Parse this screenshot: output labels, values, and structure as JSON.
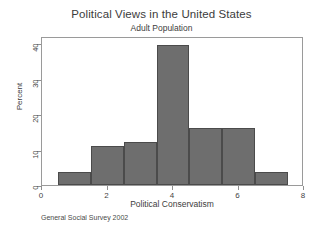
{
  "chart_data": {
    "type": "bar",
    "title": "Political Views in the United States",
    "subtitle": "Adult Population",
    "xlabel": "Political Conservatism",
    "ylabel": "Percent",
    "source_note": "General Social Survey 2002",
    "grid": false,
    "legend": null,
    "legend_position": "none",
    "bin_width": 1,
    "bin_edges": [
      0.5,
      1.5,
      2.5,
      3.5,
      4.5,
      5.5,
      6.5,
      7.5
    ],
    "categories": [
      "1",
      "2",
      "3",
      "4",
      "5",
      "6",
      "7"
    ],
    "x": [
      1,
      2,
      3,
      4,
      5,
      6,
      7
    ],
    "values": [
      3.8,
      11,
      12,
      39.5,
      16,
      16,
      3.8
    ],
    "xlim": [
      0,
      8
    ],
    "ylim": [
      0,
      42
    ],
    "xticks": [
      "0",
      "2",
      "4",
      "6",
      "8"
    ],
    "xtick_values": [
      0,
      2,
      4,
      6,
      8
    ],
    "yticks": [
      "0",
      "10",
      "20",
      "30",
      "40"
    ],
    "ytick_values": [
      0,
      10,
      20,
      30,
      40
    ],
    "bar_color": "#6e6e6e",
    "bar_edge_color": "#4b4b4b",
    "frame_color": "#9a9a9a",
    "background_color": "#ffffff"
  }
}
